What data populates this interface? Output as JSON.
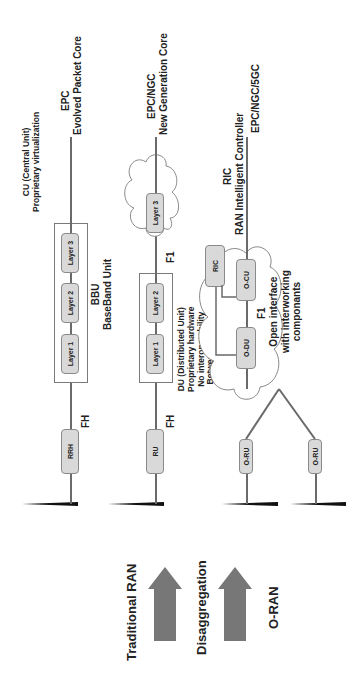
{
  "stages": {
    "traditional": "Traditional RAN",
    "disaggregation": "Disaggregation",
    "oran": "O-RAN"
  },
  "traditional_row": {
    "rrh": "RRH",
    "fh": "FH",
    "layers": [
      "Layer 1",
      "Layer 2",
      "Layer 3"
    ],
    "bbu_title": "BBU",
    "bbu_sub": "BaseBand Unit",
    "cu_title": "CU (Central Unit)",
    "cu_sub": "Proprietary virtualization",
    "core_title": "EPC",
    "core_sub": "Evolved Packet Core"
  },
  "disaggregation_row": {
    "ru": "RU",
    "fh": "FH",
    "layers": [
      "Layer 1",
      "Layer 2",
      "Layer 3"
    ],
    "f1": "F1",
    "du_lines": [
      "DU (Distributed Unit)",
      "Proprietary hardware",
      "No interoperability",
      "Between vendors"
    ],
    "core_title": "EPC/NGC",
    "core_sub": "New Generation Core"
  },
  "oran_row": {
    "oru": [
      "O-RU",
      "O-RU"
    ],
    "odu": "O-DU",
    "ocu": "O-CU",
    "ric": "RIC",
    "f1": "F1",
    "ric_title": "RIC",
    "ric_sub": "RAN Intelligent Controller",
    "core": "EPC/NGC/5GC",
    "open_lines": [
      "Open interface",
      "with interworking",
      "componants"
    ]
  },
  "colors": {
    "line": "#6a6a6a",
    "box_fill": "#d9d9d9",
    "arrow": "#777777",
    "text": "#222222"
  }
}
